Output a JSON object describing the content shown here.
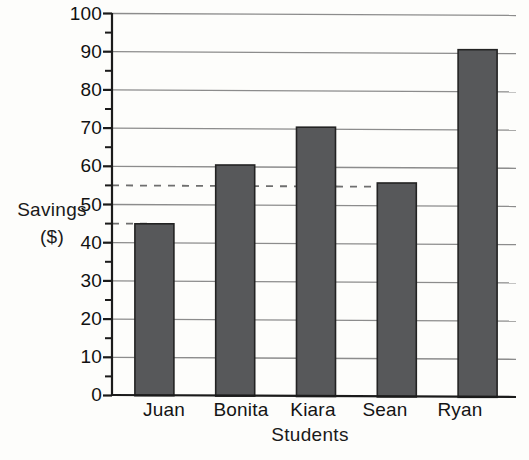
{
  "chart_data": {
    "type": "bar",
    "title": "",
    "subtitle": "",
    "xlabel": "Students",
    "ylabel": "Savings ($)",
    "ylabel_lines": [
      "Savings",
      "($)"
    ],
    "categories": [
      "Juan",
      "Bonita",
      "Kiara",
      "Sean",
      "Ryan"
    ],
    "values": [
      45,
      60.5,
      70.5,
      56,
      91
    ],
    "series": [
      {
        "name": "Savings",
        "values": [
          45,
          60.5,
          70.5,
          56,
          91
        ]
      }
    ],
    "ylim": [
      0,
      100
    ],
    "y_tick_labels": [
      "0",
      "10",
      "20",
      "30",
      "40",
      "50",
      "60",
      "70",
      "80",
      "90",
      "100"
    ],
    "y_major_ticks": [
      0,
      10,
      20,
      30,
      40,
      50,
      60,
      70,
      80,
      90,
      100
    ],
    "y_minor_ticks": [
      5,
      15,
      25,
      35,
      45,
      55,
      65,
      75,
      85,
      95
    ],
    "grid": "horizontal-major-only",
    "legend": "none",
    "annotations": [
      {
        "type": "dashed-reference-line",
        "value": 45,
        "label": "45",
        "from_category": "axis",
        "to_category": "Juan"
      },
      {
        "type": "dashed-reference-line",
        "value": 55,
        "label": "55",
        "from_category": "axis",
        "to_category": "Sean"
      }
    ],
    "colors": {
      "bar_fill": "#57585a",
      "bar_edge": "#232323",
      "grid": "#8c8c8c",
      "axis": "#1b1b1b",
      "dashed": "#6f6f6f",
      "background": "#fdfdfb",
      "text": "#141414"
    }
  }
}
